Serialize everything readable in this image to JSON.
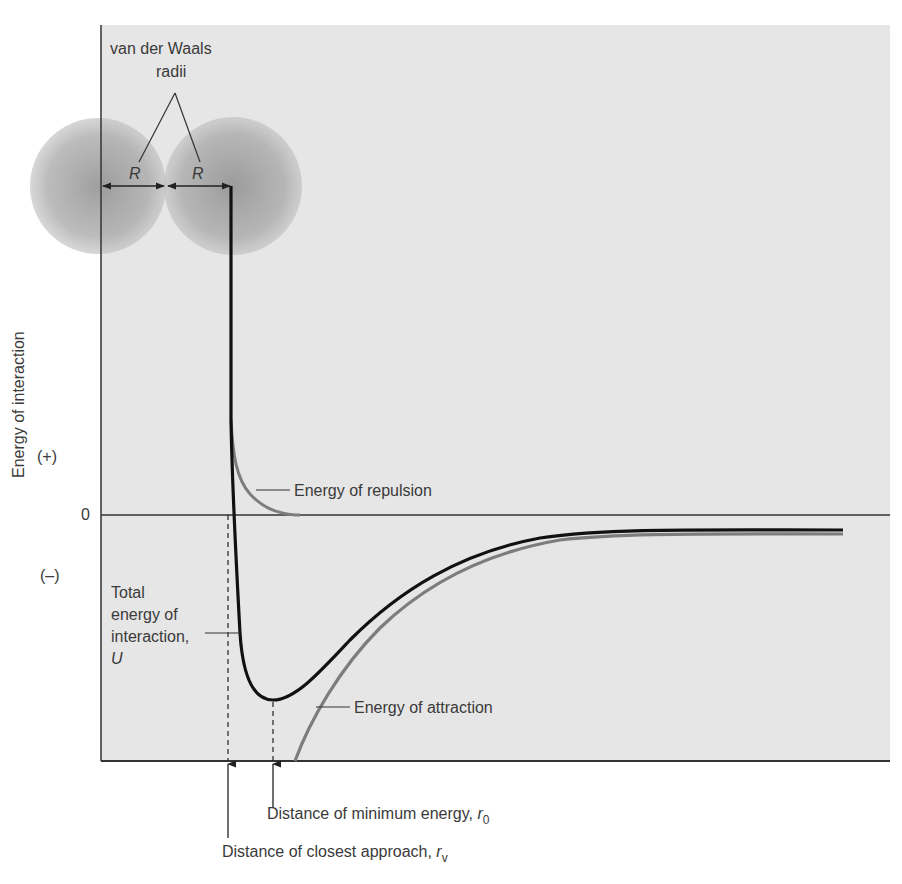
{
  "figure": {
    "title": "",
    "y_axis_label": "Energy of interaction",
    "y_ticks": {
      "positive": "(+)",
      "zero": "0",
      "negative": "(–)"
    },
    "spheres": {
      "label_line1": "van der Waals",
      "label_line2": "radii",
      "radius_symbol": "R"
    },
    "curves": {
      "repulsion_label": "Energy of repulsion",
      "attraction_label": "Energy of attraction",
      "total_label_line1": "Total",
      "total_label_line2": "energy of",
      "total_label_line3": "interaction,",
      "total_label_symbol": "U"
    },
    "markers": {
      "min_energy_label": "Distance of minimum energy,",
      "min_energy_symbol": "r",
      "min_energy_subscript": "0",
      "closest_approach_label": "Distance of closest approach,",
      "closest_approach_symbol": "r",
      "closest_approach_subscript": "v"
    },
    "colors": {
      "panel_background": "#e6e6e6",
      "total_curve": "#111111",
      "component_curves": "#808080",
      "sphere_fill": "#9a9a9a",
      "axis": "#333333"
    }
  }
}
